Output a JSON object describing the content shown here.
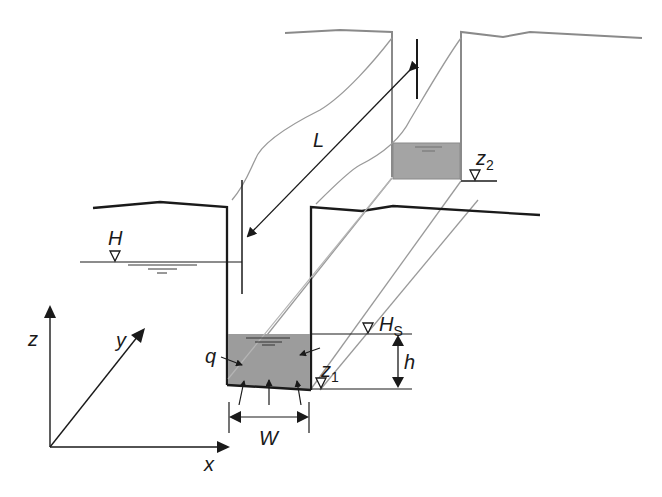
{
  "diagram": {
    "type": "trench cross-section with seepage between two parallel trenches",
    "colors": {
      "line_dark": "#1a1a1a",
      "line_gray": "#808080",
      "line_light": "#a8a8a8",
      "water_fill": "#9c9c9c",
      "water_fill_back": "#a4a4a4",
      "background": "#ffffff"
    },
    "labels": {
      "L": "L",
      "H": "H",
      "z2": "z",
      "z2_sub": "2",
      "Hs": "H",
      "Hs_sub": "S",
      "z1": "z",
      "z1_sub": "1",
      "h": "h",
      "q": "q",
      "W": "W",
      "axis_x": "x",
      "axis_y": "y",
      "axis_z": "z"
    },
    "symbols": {
      "water_level_marker": "inverted-triangle",
      "dimension_arrows": [
        "L",
        "h",
        "W"
      ]
    }
  }
}
